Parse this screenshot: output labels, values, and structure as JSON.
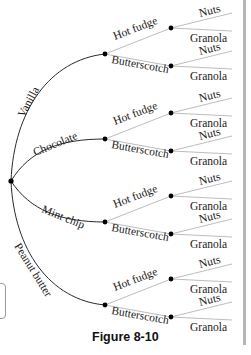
{
  "figure": {
    "caption": "Figure 8-10",
    "type": "tree-diagram",
    "root": {
      "children": [
        {
          "label": "Vanilla",
          "children": [
            {
              "label": "Hot fudge",
              "children": [
                {
                  "label": "Nuts"
                },
                {
                  "label": "Granola"
                }
              ]
            },
            {
              "label": "Butterscotch",
              "children": [
                {
                  "label": "Nuts"
                },
                {
                  "label": "Granola"
                }
              ]
            }
          ]
        },
        {
          "label": "Chocolate",
          "children": [
            {
              "label": "Hot fudge",
              "children": [
                {
                  "label": "Nuts"
                },
                {
                  "label": "Granola"
                }
              ]
            },
            {
              "label": "Butterscotch",
              "children": [
                {
                  "label": "Nuts"
                },
                {
                  "label": "Granola"
                }
              ]
            }
          ]
        },
        {
          "label": "Mint chip",
          "children": [
            {
              "label": "Hot fudge",
              "children": [
                {
                  "label": "Nuts"
                },
                {
                  "label": "Granola"
                }
              ]
            },
            {
              "label": "Butterscotch",
              "children": [
                {
                  "label": "Nuts"
                },
                {
                  "label": "Granola"
                }
              ]
            }
          ]
        },
        {
          "label": "Peanut butter",
          "children": [
            {
              "label": "Hot fudge",
              "children": [
                {
                  "label": "Nuts"
                },
                {
                  "label": "Granola"
                }
              ]
            },
            {
              "label": "Butterscotch",
              "children": [
                {
                  "label": "Nuts"
                },
                {
                  "label": "Granola"
                }
              ]
            }
          ]
        }
      ]
    }
  },
  "labels": {
    "flavors": [
      "Vanilla",
      "Chocolate",
      "Mint chip",
      "Peanut butter"
    ],
    "toppings": [
      "Hot fudge",
      "Butterscotch"
    ],
    "extras": [
      "Nuts",
      "Granola"
    ]
  },
  "colors": {
    "main_branch": "#2a2a2a",
    "sub_branch": "#bdbdbd",
    "node": "#000000",
    "text": "#1a1a1a",
    "side_bar": "#b5b5b5"
  }
}
